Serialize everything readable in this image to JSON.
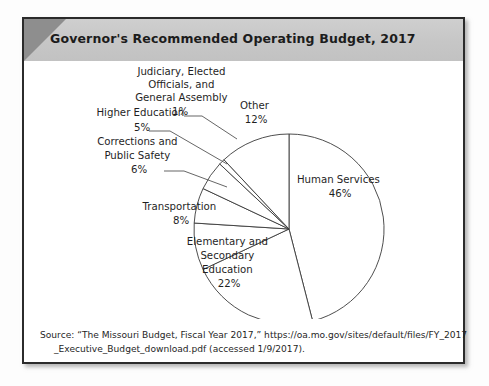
{
  "header": {
    "title": "Governor's Recommended Operating Budget, 2017"
  },
  "source": {
    "line1": "Source: “The Missouri Budget, Fiscal Year 2017,” https://oa.mo.gov/sites/default/files/FY_2017",
    "line2": "_Executive_Budget_download.pdf (accessed 1/9/2017)."
  },
  "chart_data": {
    "type": "pie",
    "title": "Governor's Recommended Operating Budget, 2017",
    "xlabel": "",
    "ylabel": "",
    "units": "percent",
    "start_angle_deg": 0,
    "direction": "clockwise",
    "legend": "none",
    "labels_inline": true,
    "categories": [
      "Human Services",
      "Elementary and Secondary Education",
      "Transportation",
      "Corrections and Public Safety",
      "Higher Education",
      "Judiciary, Elected Officials, and General Assembly",
      "Other"
    ],
    "values": [
      46,
      22,
      8,
      6,
      5,
      1,
      12
    ],
    "slices": [
      {
        "name": "Human Services",
        "value": 46,
        "value_label": "46%",
        "label_lines": [
          "Human Services",
          "46%"
        ],
        "placement": "inside"
      },
      {
        "name": "Elementary and Secondary Education",
        "value": 22,
        "value_label": "22%",
        "label_lines": [
          "Elementary and",
          "Secondary",
          "Education",
          "22%"
        ],
        "placement": "inside"
      },
      {
        "name": "Transportation",
        "value": 8,
        "value_label": "8%",
        "label_lines": [
          "Transportation",
          "8%"
        ],
        "placement": "inside"
      },
      {
        "name": "Corrections and Public Safety",
        "value": 6,
        "value_label": "6%",
        "label_lines": [
          "Corrections and",
          "Public Safety",
          "6%"
        ],
        "placement": "outside-left"
      },
      {
        "name": "Higher Education",
        "value": 5,
        "value_label": "5%",
        "label_lines": [
          "Higher Education",
          "5%"
        ],
        "placement": "outside-left"
      },
      {
        "name": "Judiciary, Elected Officials, and General Assembly",
        "value": 1,
        "value_label": "1%",
        "label_lines": [
          "Judiciary, Elected",
          "Officials, and",
          "General Assembly",
          "1%"
        ],
        "placement": "outside-top"
      },
      {
        "name": "Other",
        "value": 12,
        "value_label": "12%",
        "label_lines": [
          "Other",
          "12%"
        ],
        "placement": "inside"
      }
    ],
    "colors": {
      "slice_fill": "#ffffff",
      "slice_stroke": "#3a3a3a",
      "header_bg": "#c6c6c6",
      "header_corner": "#8e8e8e",
      "frame_border": "#2b2b2b",
      "text": "#1f1f1f"
    }
  }
}
